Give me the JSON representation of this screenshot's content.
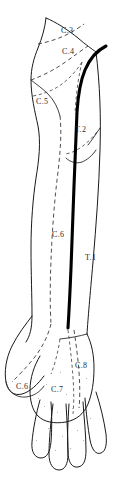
{
  "figure": {
    "view": "anterior",
    "width": 125,
    "height": 478,
    "background_color": "#ffffff",
    "line_color": "#1a1a1a",
    "axial_line_color": "#000000",
    "boundary_style": "dashed"
  },
  "labels": [
    {
      "id": "c3",
      "text": "C.3",
      "x": 61,
      "y": 27,
      "dermatome": "C3"
    },
    {
      "id": "c4",
      "text": "C.4",
      "x": 62,
      "y": 48,
      "dermatome": "C4"
    },
    {
      "id": "c5",
      "text": "C.5",
      "x": 36,
      "y": 98,
      "dermatome": "C5"
    },
    {
      "id": "t2",
      "text": "T.2",
      "x": 75,
      "y": 126,
      "dermatome": "T2"
    },
    {
      "id": "c6_arm",
      "text": "C.6",
      "x": 52,
      "y": 231,
      "dermatome": "C6"
    },
    {
      "id": "t1",
      "text": "T.1",
      "x": 85,
      "y": 254,
      "dermatome": "T1"
    },
    {
      "id": "c8",
      "text": "C.8",
      "x": 75,
      "y": 362,
      "dermatome": "C8"
    },
    {
      "id": "c6_hand",
      "text": "C.6",
      "x": 16,
      "y": 383,
      "dermatome": "C6"
    },
    {
      "id": "c7",
      "text": "C.7",
      "x": 51,
      "y": 386,
      "dermatome": "C7"
    }
  ],
  "geometry": {
    "arm_outer_edge": "M 96 52 C 100 84, 101 118, 100 150 C 99 188, 96 226, 93 262 C 90 296, 88 318, 87 334",
    "arm_inner_edge": "M 46 18 C 45 28, 42 38, 38 48 C 34 58, 31 68, 31 80 C 31 96, 35 112, 38 126 C 41 142, 39 160, 36 178 C 33 198, 31 222, 31 248 C 31 274, 32 296, 32 316 C 32 328, 30 336, 26 342",
    "shoulder_top": "M 46 18 C 56 22, 68 30, 78 38 C 86 45, 92 49, 96 52",
    "deltoid_notch": "M 31 80 C 36 84, 42 88, 48 94 C 54 100, 58 108, 60 116",
    "axilla_fold": "M 96 150 C 92 156, 87 160, 82 162 C 76 164, 70 162, 66 158",
    "wrist_crease": "M 87 334 C 80 336, 70 338, 60 339",
    "thumb_web": "M 32 316 C 26 324, 18 334, 12 346 C 6 358, 4 372, 6 382 C 8 392, 14 396, 22 394 C 30 392, 38 384, 44 376",
    "thumb_tip": "M 6 382 C 8 392, 16 398, 26 397 C 34 396, 40 392, 44 386",
    "palm_outline": "M 87 334 C 92 344, 94 356, 94 368 C 94 382, 92 394, 88 404 C 84 414, 76 420, 66 422 C 54 424, 44 422, 38 416 C 32 410, 30 400, 30 390 C 30 378, 34 366, 40 356",
    "axial_line_black": "M 106 46 C 98 50, 90 58, 85 70 C 80 82, 78 96, 77 112 C 76 132, 75 158, 74 186 C 73 214, 72 242, 71 268 C 70 292, 69 312, 68 328",
    "finger_1": "M 40 400 C 36 414, 33 430, 32 442 C 31 452, 35 458, 41 458 C 47 458, 50 452, 51 442 C 52 430, 52 414, 51 402",
    "finger_2": "M 53 404 C 51 420, 49 440, 49 454 C 49 464, 53 470, 59 470 C 65 470, 68 464, 68 454 C 68 438, 67 420, 66 404",
    "finger_3": "M 69 404 C 68 420, 67 438, 68 452 C 68 462, 72 468, 78 467 C 84 466, 86 460, 86 450 C 86 434, 84 418, 83 402",
    "finger_4": "M 85 398 C 86 412, 88 428, 90 440 C 92 450, 96 455, 101 453 C 106 451, 107 444, 106 434 C 104 420, 100 404, 96 392"
  },
  "dermatome_boundaries": {
    "c3_c4_boundary": "M 38 44 C 48 42, 58 39, 66 35 C 74 31, 80 27, 84 24",
    "c4_c5_boundary": "M 31 80 C 42 76, 54 70, 64 63 C 74 56, 82 50, 88 46",
    "c5_upper": "M 33 96 C 44 94, 54 90, 62 84 C 70 78, 77 70, 82 62",
    "c5_c6_long": "M 60 116 C 62 134, 60 156, 57 180 C 54 206, 52 234, 51 260 C 50 286, 50 308, 51 324",
    "c5_medial": "M 82 62 C 78 78, 76 96, 75 114",
    "t2_boundary": "M 97 132 C 92 138, 86 144, 80 148 C 74 152, 68 154, 64 154",
    "t2_tail": "M 100 128 C 96 134, 92 140, 88 145",
    "c6_c7_hand": "M 51 324 C 48 336, 42 348, 34 358 C 26 368, 18 376, 12 382",
    "c8_boundary": "M 74 330 C 76 344, 78 358, 79 372 C 80 386, 80 398, 79 408",
    "c7_c8_palm": "M 68 330 C 70 346, 72 362, 73 378 C 74 392, 74 404, 73 414",
    "hand_dorsal_split": "M 60 339 C 58 352, 55 364, 51 374"
  },
  "speckles": [
    {
      "x": 44,
      "y": 406
    },
    {
      "x": 57,
      "y": 412
    },
    {
      "x": 72,
      "y": 408
    },
    {
      "x": 84,
      "y": 400
    },
    {
      "x": 48,
      "y": 428
    },
    {
      "x": 62,
      "y": 436
    },
    {
      "x": 77,
      "y": 430
    },
    {
      "x": 38,
      "y": 398
    },
    {
      "x": 66,
      "y": 394
    },
    {
      "x": 90,
      "y": 418
    },
    {
      "x": 55,
      "y": 450
    },
    {
      "x": 70,
      "y": 448
    },
    {
      "x": 36,
      "y": 440
    },
    {
      "x": 83,
      "y": 440
    },
    {
      "x": 60,
      "y": 372
    },
    {
      "x": 86,
      "y": 378
    },
    {
      "x": 46,
      "y": 384
    }
  ]
}
